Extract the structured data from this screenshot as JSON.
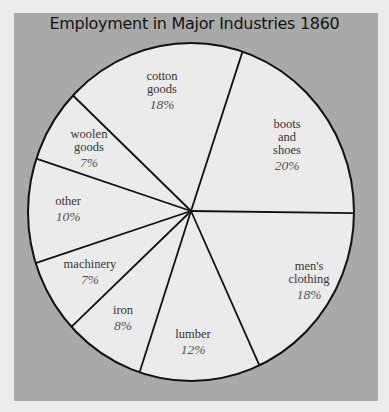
{
  "chart_data": {
    "type": "pie",
    "title": "Employment in Major Industries 1860",
    "start_angle_deg": 18.4,
    "direction": "clockwise",
    "slices": [
      {
        "label": [
          "boots",
          "and",
          "shoes"
        ],
        "name": "boots and shoes",
        "value": 20,
        "display": "20%",
        "lx": 287,
        "ly": 128
      },
      {
        "label": [
          "men's",
          "clothing"
        ],
        "name": "men's clothing",
        "value": 18,
        "display": "18%",
        "lx": 309,
        "ly": 270
      },
      {
        "label": [
          "lumber"
        ],
        "name": "lumber",
        "value": 12,
        "display": "12%",
        "lx": 193,
        "ly": 338
      },
      {
        "label": [
          "iron"
        ],
        "name": "iron",
        "value": 8,
        "display": "8%",
        "lx": 123,
        "ly": 314
      },
      {
        "label": [
          "machinery"
        ],
        "name": "machinery",
        "value": 7,
        "display": "7%",
        "lx": 90,
        "ly": 268
      },
      {
        "label": [
          "other"
        ],
        "name": "other",
        "value": 10,
        "display": "10%",
        "lx": 68,
        "ly": 205
      },
      {
        "label": [
          "woolen",
          "goods"
        ],
        "name": "woolen goods",
        "value": 7,
        "display": "7%",
        "lx": 89,
        "ly": 138
      },
      {
        "label": [
          "cotton",
          "goods"
        ],
        "name": "cotton goods",
        "value": 18,
        "display": "18%",
        "lx": 162,
        "ly": 80
      }
    ],
    "colors": {
      "slice_fill": "#ebebeb",
      "stroke": "#111111",
      "panel": "#a9a9a9",
      "background": "#ececec"
    }
  }
}
